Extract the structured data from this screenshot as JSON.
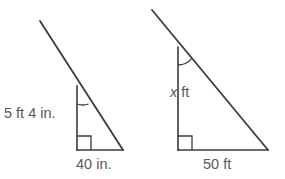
{
  "figure": {
    "type": "geometry-diagram",
    "stroke_color": "#3b3b3b",
    "text_color": "#58595b",
    "background_color": "#ffffff",
    "triangles": [
      {
        "id": "left-triangle",
        "name": "smaller-triangle",
        "vertical_label": "5 ft 4 in.",
        "base_label": "40 in.",
        "apex_angle_mark": "arc",
        "base_angle_mark": "right-angle-square",
        "units": {
          "vertical": "ft/in",
          "base": "in."
        },
        "vertices": {
          "apex": [
            77,
            86
          ],
          "base_left": [
            77,
            150
          ],
          "base_right": [
            123,
            150
          ]
        },
        "ray_extension_endpoint": [
          40,
          21
        ]
      },
      {
        "id": "right-triangle",
        "name": "larger-triangle",
        "vertical_label": "x ft",
        "base_label": "50 ft",
        "apex_angle_mark": "arc",
        "base_angle_mark": "right-angle-square",
        "units": {
          "vertical": "ft",
          "base": "ft"
        },
        "vertices": {
          "apex": [
            178,
            47
          ],
          "base_left": [
            178,
            150
          ],
          "base_right": [
            268,
            150
          ]
        },
        "ray_extension_endpoint": [
          152,
          10
        ]
      }
    ]
  }
}
